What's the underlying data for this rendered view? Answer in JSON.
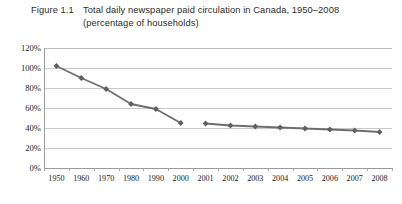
{
  "figure": {
    "label": "Figure 1.1",
    "title_line1": "Total daily newspaper paid circulation in Canada, 1950–2008",
    "title_line2": "(percentage of households)"
  },
  "chart_data": {
    "type": "line",
    "title": "Total daily newspaper paid circulation in Canada, 1950–2008 (percentage of households)",
    "xlabel": "",
    "ylabel": "",
    "ylim": [
      0,
      120
    ],
    "ytick_labels": [
      "120%",
      "100%",
      "80%",
      "60%",
      "40%",
      "20%",
      "0%"
    ],
    "ytick_values": [
      120,
      100,
      80,
      60,
      40,
      20,
      0
    ],
    "grid": true,
    "legend": "none",
    "marker": "diamond",
    "line_color": "#6e6e6e",
    "marker_color": "#5f5f5f",
    "categories": [
      "1950",
      "1960",
      "1970",
      "1980",
      "1990",
      "2000",
      "2001",
      "2002",
      "2003",
      "2004",
      "2005",
      "2006",
      "2007",
      "2008"
    ],
    "series": [
      {
        "name": "Decades 1950–2000",
        "x": [
          "1950",
          "1960",
          "1970",
          "1980",
          "1990",
          "2000"
        ],
        "values": [
          102,
          90,
          79,
          64,
          59,
          45
        ]
      },
      {
        "name": "Annual 2001–2008",
        "x": [
          "2001",
          "2002",
          "2003",
          "2004",
          "2005",
          "2006",
          "2007",
          "2008"
        ],
        "values": [
          44.5,
          42.5,
          41.5,
          40.5,
          39.5,
          38.5,
          37.5,
          36
        ]
      }
    ]
  }
}
